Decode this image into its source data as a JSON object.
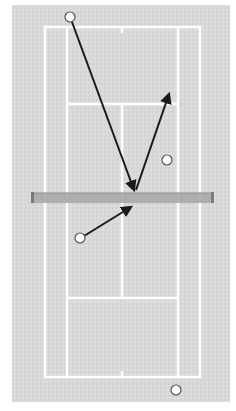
{
  "diagram": {
    "type": "tennis-court-shot-diagram",
    "orientation": "vertical",
    "colors": {
      "background": "#ffffff",
      "court_surface": "#d9d9d9",
      "court_lines": "#ffffff",
      "net": "#a8a8a8",
      "net_posts": "#7a7a7a",
      "arrows": "#1a1a1a",
      "ball_fill": "#ffffff",
      "ball_stroke": "#555555"
    },
    "court": {
      "surface": {
        "x": 12,
        "y": 5,
        "w": 218,
        "h": 397
      },
      "outer_lines": {
        "x1": 45,
        "y1": 27,
        "x2": 200,
        "y2": 377
      },
      "service_boxes": {
        "x1": 67,
        "x2": 178,
        "top_y": 104,
        "bottom_y": 298
      },
      "center_line_x": 122,
      "center_marks": [
        {
          "y1": 27,
          "y2": 33
        },
        {
          "y1": 371,
          "y2": 377
        }
      ]
    },
    "net": {
      "x1": 32,
      "x2": 213,
      "y": 193,
      "h": 10
    },
    "balls": [
      {
        "id": "ball-top-left",
        "cx": 70,
        "cy": 17,
        "r": 5
      },
      {
        "id": "ball-right-service-box",
        "cx": 167,
        "cy": 160,
        "r": 5
      },
      {
        "id": "ball-lower-left",
        "cx": 80,
        "cy": 238,
        "r": 5
      },
      {
        "id": "ball-bottom-right",
        "cx": 176,
        "cy": 390,
        "r": 5
      }
    ],
    "arrows": [
      {
        "id": "arrow-serve-path",
        "x1": 72,
        "y1": 22,
        "x2": 134,
        "y2": 190
      },
      {
        "id": "arrow-bounce-path",
        "x1": 136,
        "y1": 190,
        "x2": 169,
        "y2": 94
      },
      {
        "id": "arrow-return-path",
        "x1": 84,
        "y1": 236,
        "x2": 131,
        "y2": 207
      }
    ]
  }
}
